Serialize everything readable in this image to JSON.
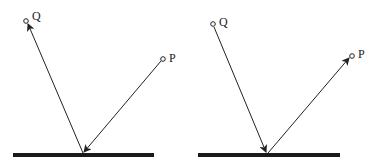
{
  "diagrams": [
    {
      "id": "left",
      "labels": {
        "q": "Q",
        "p": "P"
      },
      "direction": "P to surface to Q"
    },
    {
      "id": "right",
      "labels": {
        "q": "Q",
        "p": "P"
      },
      "direction": "Q to surface to P"
    }
  ],
  "colors": {
    "ink": "#222222",
    "surface": "#1a1a1a"
  }
}
